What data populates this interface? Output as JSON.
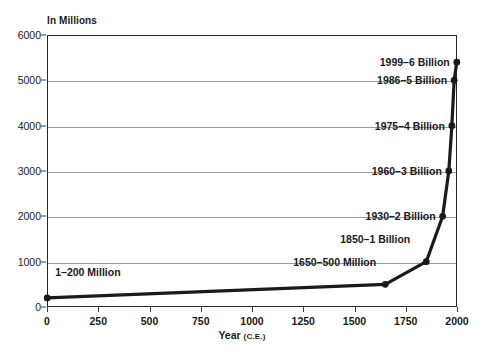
{
  "chart_data": {
    "type": "line",
    "title": "",
    "xlabel": "Year (C.E.)",
    "ylabel": "In Millions",
    "xlim": [
      0,
      2000
    ],
    "ylim": [
      0,
      6000
    ],
    "grid": true,
    "legend": "none",
    "x": [
      1,
      1650,
      1850,
      1930,
      1960,
      1975,
      1986,
      1999
    ],
    "values": [
      200,
      500,
      1000,
      2000,
      3000,
      4000,
      5000,
      5400
    ],
    "xticks": [
      0,
      250,
      500,
      750,
      1000,
      1250,
      1500,
      1750,
      2000
    ],
    "yticks": [
      0,
      1000,
      2000,
      3000,
      4000,
      5000,
      6000
    ],
    "annotations": [
      {
        "label": "1–200 Million",
        "year": 1,
        "population": 200,
        "anchor": "left"
      },
      {
        "label": "1650–500 Million",
        "year": 1650,
        "population": 500,
        "anchor": "right"
      },
      {
        "label": "1850–1 Billion",
        "year": 1850,
        "population": 1000,
        "anchor": "right"
      },
      {
        "label": "1930–2 Billion",
        "year": 1930,
        "population": 2000,
        "anchor": "right"
      },
      {
        "label": "1960–3 Billion",
        "year": 1960,
        "population": 3000,
        "anchor": "right"
      },
      {
        "label": "1975–4 Billion",
        "year": 1975,
        "population": 4000,
        "anchor": "right"
      },
      {
        "label": "1986–5 Billion",
        "year": 1986,
        "population": 5000,
        "anchor": "right"
      },
      {
        "label": "1999–6 Billion",
        "year": 1999,
        "population": 5400,
        "anchor": "right"
      }
    ],
    "colors": {
      "line": "#1a1a1a",
      "marker": "#1a1a1a",
      "grid": "#9a9a9a",
      "axis": "#262626",
      "background": "#ffffff"
    }
  },
  "axis": {
    "y_unit_caption": "In Millions",
    "x_title_main": "Year",
    "x_title_era": "(C.E.)"
  }
}
